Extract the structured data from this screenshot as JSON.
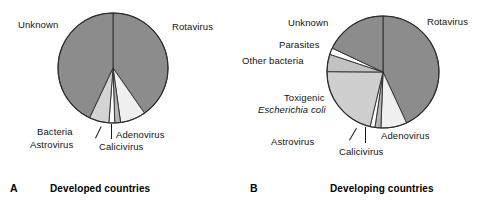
{
  "figure": {
    "panels": [
      {
        "id": "A",
        "letter": "A",
        "caption": "Developed countries",
        "labels": {
          "unknown": "Unknown",
          "rotavirus": "Rotavirus",
          "bacteria": "Bacteria",
          "astrovirus": "Astrovirus",
          "calicivirus": "Calicivirus",
          "adenovirus": "Adenovirus"
        }
      },
      {
        "id": "B",
        "letter": "B",
        "caption": "Developing countries",
        "labels": {
          "unknown": "Unknown",
          "parasites": "Parasites",
          "other_bacteria": "Other bacteria",
          "rotavirus": "Rotavirus",
          "toxigenic": "Toxigenic",
          "ecoli": "Escherichia coli",
          "astrovirus": "Astrovirus",
          "calicivirus": "Calicivirus",
          "adenovirus": "Adenovirus"
        }
      }
    ]
  },
  "chart_data": [
    {
      "type": "pie",
      "title": "Developed countries",
      "panel": "A",
      "units": "percent of cases",
      "legend": "inline-labels",
      "start_angle_deg": 0,
      "direction": "clockwise",
      "categories": [
        "Rotavirus",
        "Adenovirus",
        "Calicivirus",
        "Astrovirus",
        "Bacteria",
        "Unknown"
      ],
      "values": [
        40.3,
        7.5,
        1.7,
        1.7,
        5.8,
        43.0
      ],
      "colors": [
        "#8c8c8c",
        "#f0f0f0",
        "#b5b5b5",
        "#ffffff",
        "#d4d4d4",
        "#8c8c8c"
      ]
    },
    {
      "type": "pie",
      "title": "Developing countries",
      "panel": "B",
      "units": "percent of cases",
      "legend": "inline-labels",
      "start_angle_deg": 0,
      "direction": "clockwise",
      "categories": [
        "Rotavirus",
        "Adenovirus",
        "Calicivirus",
        "Astrovirus",
        "Toxigenic Escherichia coli",
        "Other bacteria",
        "Parasites",
        "Unknown"
      ],
      "values": [
        43.1,
        7.5,
        1.7,
        1.4,
        21.4,
        5.0,
        1.9,
        18.0
      ],
      "colors": [
        "#8c8c8c",
        "#f0f0f0",
        "#b5b5b5",
        "#ffffff",
        "#cfcfcf",
        "#c2c2c2",
        "#ffffff",
        "#8c8c8c"
      ]
    }
  ]
}
